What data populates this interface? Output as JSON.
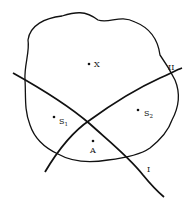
{
  "diagram": {
    "stroke_color": "#111111",
    "background": "#ffffff",
    "points": [
      {
        "id": "X",
        "label": "X",
        "x": 89,
        "y": 64
      },
      {
        "id": "S1",
        "label": "S",
        "subscript": "1",
        "x": 54,
        "y": 117
      },
      {
        "id": "S2",
        "label": "S",
        "subscript": "2",
        "x": 138,
        "y": 110
      },
      {
        "id": "A",
        "label": "A",
        "x": 93,
        "y": 141
      }
    ],
    "curves": [
      {
        "id": "I",
        "label": "I"
      },
      {
        "id": "II",
        "label": "II"
      }
    ],
    "region": {
      "label": "closed irregular region"
    }
  }
}
